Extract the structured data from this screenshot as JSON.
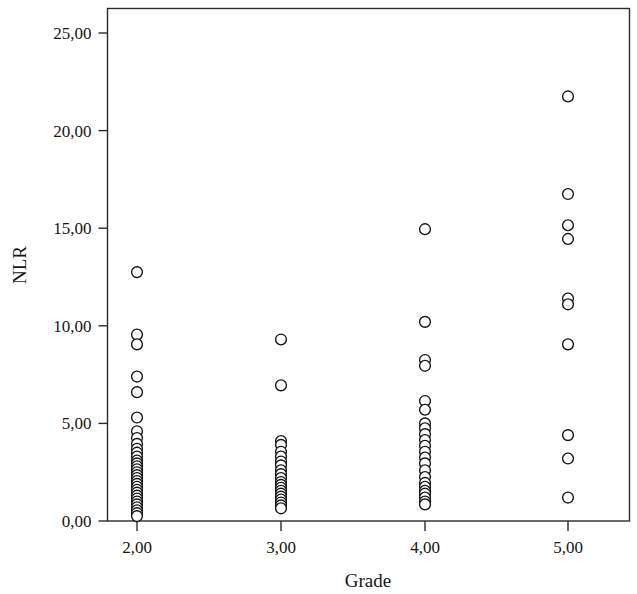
{
  "chart_data": {
    "type": "scatter",
    "title": "",
    "xlabel": "Grade",
    "ylabel": "NLR",
    "xlim": [
      1.55,
      5.45
    ],
    "ylim": [
      0,
      26.8
    ],
    "grid": false,
    "legend": "none",
    "decimal_separator": ",",
    "x_tick_values": [
      2,
      3,
      4,
      5
    ],
    "x_tick_labels": [
      "2,00",
      "3,00",
      "4,00",
      "5,00"
    ],
    "y_tick_values": [
      0,
      5,
      10,
      15,
      20,
      25
    ],
    "y_tick_labels": [
      "0,00",
      "5,00",
      "10,00",
      "15,00",
      "20,00",
      "25,00"
    ],
    "marker": {
      "shape": "open-circle",
      "radius_px": 5.4,
      "edge_color": "#111111",
      "face_color": "#ffffff"
    },
    "series": [
      {
        "name": "Grade 2",
        "x": 2,
        "values": [
          12.75,
          9.55,
          9.05,
          7.4,
          6.6,
          5.3,
          4.6,
          4.25,
          3.95,
          3.7,
          3.5,
          3.3,
          3.1,
          2.95,
          2.8,
          2.65,
          2.5,
          2.35,
          2.2,
          2.05,
          1.9,
          1.75,
          1.6,
          1.45,
          1.3,
          1.15,
          1.0,
          0.85,
          0.7,
          0.55,
          0.4,
          0.25
        ]
      },
      {
        "name": "Grade 3",
        "x": 3,
        "values": [
          9.3,
          6.95,
          4.1,
          3.9,
          3.55,
          3.3,
          3.05,
          2.85,
          2.6,
          2.4,
          2.2,
          2.0,
          1.85,
          1.7,
          1.55,
          1.4,
          1.25,
          1.1,
          0.95,
          0.8,
          0.65
        ]
      },
      {
        "name": "Grade 4",
        "x": 4,
        "values": [
          14.95,
          10.2,
          8.25,
          7.95,
          6.15,
          5.7,
          5.0,
          4.75,
          4.45,
          4.15,
          3.85,
          3.55,
          3.25,
          2.95,
          2.6,
          2.25,
          1.95,
          1.75,
          1.55,
          1.4,
          1.2,
          1.0,
          0.85
        ]
      },
      {
        "name": "Grade 5",
        "x": 5,
        "values": [
          21.75,
          16.75,
          15.15,
          14.45,
          11.4,
          11.1,
          9.05,
          4.4,
          3.2,
          1.2
        ]
      }
    ]
  },
  "axis": {
    "x_title": "Grade",
    "y_title": "NLR"
  }
}
